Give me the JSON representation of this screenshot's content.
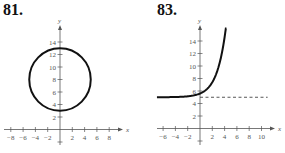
{
  "problems": [
    {
      "number": "81."
    },
    {
      "number": "83."
    }
  ],
  "chart_data": [
    {
      "type": "line",
      "title": "81.",
      "xlabel": "x",
      "ylabel": "y",
      "xticks": [
        -8,
        -6,
        -4,
        -2,
        2,
        4,
        6,
        8
      ],
      "yticks": [
        2,
        4,
        6,
        8,
        10,
        12,
        14
      ],
      "xlim": [
        -9,
        10
      ],
      "ylim": [
        -2,
        15
      ],
      "series": [
        {
          "name": "circle",
          "shape": "circle",
          "center": [
            0,
            8
          ],
          "radius": 5
        }
      ],
      "grid": false
    },
    {
      "type": "line",
      "title": "83.",
      "xlabel": "x",
      "ylabel": "y",
      "xticks": [
        -6,
        -4,
        -2,
        2,
        4,
        6,
        8,
        10
      ],
      "yticks": [
        2,
        4,
        6,
        8,
        10,
        12,
        14
      ],
      "xlim": [
        -7,
        12
      ],
      "ylim": [
        -2,
        15
      ],
      "series": [
        {
          "name": "exponential curve",
          "x": [
            -7,
            -4,
            -2,
            0,
            1,
            2,
            3,
            4,
            4.3
          ],
          "y": [
            5.0,
            5.04,
            5.15,
            5.6,
            6.2,
            7.4,
            9.8,
            14.6,
            16.0
          ]
        },
        {
          "name": "horizontal asymptote",
          "style": "dashed",
          "y_const": 5,
          "x": [
            0,
            11
          ]
        }
      ],
      "grid": false
    }
  ]
}
